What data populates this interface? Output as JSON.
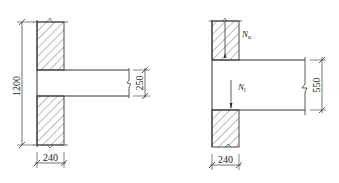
{
  "figure_left": {
    "title": "Beam 250 into wall",
    "dims": {
      "wall_height": "1200",
      "beam_depth": "250",
      "wall_thickness": "240"
    }
  },
  "figure_right": {
    "title": "Beam 550 into wall",
    "dims": {
      "beam_depth": "550",
      "wall_thickness": "240"
    },
    "loads": {
      "upper_load_symbol": "N",
      "upper_load_subscript": "u",
      "local_load_symbol": "N",
      "local_load_subscript": "l"
    }
  },
  "colors": {
    "line": "#333333",
    "hatch": "#555555",
    "background": "#ffffff"
  }
}
